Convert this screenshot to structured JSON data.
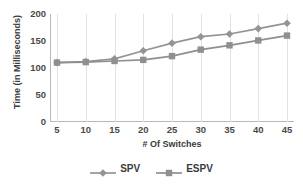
{
  "chart_data": {
    "type": "line",
    "title": "",
    "xlabel": "# Of Switches",
    "ylabel": "Time (in Milliseconds)",
    "x": [
      5,
      10,
      15,
      20,
      25,
      30,
      35,
      40,
      45
    ],
    "xtick_labels": [
      "5",
      "10",
      "15",
      "20",
      "25",
      "30",
      "35",
      "40",
      "45"
    ],
    "ytick_labels": [
      "0",
      "50",
      "100",
      "150",
      "200"
    ],
    "yticks": [
      0,
      50,
      100,
      150,
      200
    ],
    "ylim": [
      0,
      200
    ],
    "xlim": [
      5,
      45
    ],
    "grid": "vertical",
    "legend_position": "bottom",
    "series": [
      {
        "name": "SPV",
        "marker": "diamond",
        "color": "#949494",
        "values": [
          110,
          112,
          117,
          132,
          146,
          158,
          163,
          173,
          183
        ]
      },
      {
        "name": "ESPV",
        "marker": "square",
        "color": "#8f8f8f",
        "values": [
          110,
          111,
          113,
          115,
          122,
          134,
          142,
          151,
          160
        ]
      }
    ]
  },
  "colors": {
    "axis": "#b9b9b9",
    "grid": "#e2e2e2",
    "text": "#3b3b3b",
    "tick_text": "#4a4a4a",
    "spv": "#949494",
    "espv": "#8f8f8f",
    "background": "#ffffff"
  }
}
